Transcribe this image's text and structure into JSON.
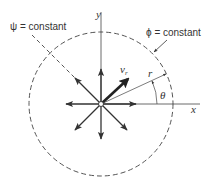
{
  "diagram": {
    "type": "source flow / radial flow field",
    "labels": {
      "psi_constant": "ψ = constant",
      "phi_constant": "ϕ = constant",
      "y_axis": "y",
      "x_axis": "x",
      "radial_velocity": "v",
      "radial_velocity_sub": "r",
      "radius": "r",
      "angle": "θ"
    },
    "colors": {
      "stroke": "#333333",
      "dashed": "#555555",
      "background": "#ffffff"
    },
    "geometry": {
      "center": [
        101,
        104
      ],
      "circle_radius": 72,
      "arrow_length": 33,
      "arrow_directions_deg": [
        0,
        45,
        90,
        135,
        180,
        225,
        270,
        315
      ],
      "radius_line_angle_deg": 25,
      "vr_angle_deg": 42
    }
  }
}
